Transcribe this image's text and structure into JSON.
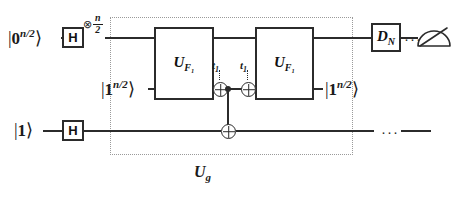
{
  "diagram": {
    "group_label": "U",
    "group_label_sub": "g",
    "ellipsis": "···"
  },
  "registers": [
    {
      "name": "top-register",
      "input_label": "|0",
      "input_superscript": "n/2",
      "input_close": "⟩",
      "output_label": ""
    },
    {
      "name": "middle-register",
      "input_label": "|1",
      "input_superscript": "n/2",
      "input_close": "⟩",
      "output_label": "|1",
      "output_superscript": "n/2",
      "output_close": "⟩"
    },
    {
      "name": "bottom-register",
      "input_label": "|1",
      "input_superscript": "",
      "input_close": "⟩",
      "output_label": ""
    }
  ],
  "gates": {
    "hadamard_top": "H",
    "hadamard_bottom": "H",
    "uf1_first": "U",
    "uf1_first_sub": "F₁",
    "uf1_second": "U",
    "uf1_second_sub": "F₁",
    "dn": "D",
    "dn_sub": "N"
  },
  "annotations": {
    "tensor_symbol": "⊗",
    "tensor_numerator": "n",
    "tensor_denominator": "2",
    "t_label_1": "t",
    "t_label_1_sub": "1",
    "t_label_2": "t",
    "t_label_2_sub": "1"
  },
  "icons": {
    "measurement": "measurement-meter-icon",
    "cnot_target": "cnot-target-icon",
    "control_dot": "control-dot-icon"
  },
  "colors": {
    "wire": "#2b2b2b",
    "gate_border": "#2b2b2b",
    "group_border": "#9a9a9a",
    "background": "#ffffff",
    "text": "#1b1b1b"
  }
}
